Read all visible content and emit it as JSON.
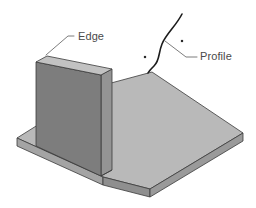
{
  "figure": {
    "background_color": "#ffffff",
    "annotations": [
      {
        "id": "edge",
        "label": "Edge",
        "text_x": 78,
        "text_y": 40,
        "leader_points": "74,36 68,36 46,55",
        "target": "top-left corner of vertical wall"
      },
      {
        "id": "profile",
        "label": "Profile",
        "text_x": 200,
        "text_y": 60,
        "leader_points": "197,57 186,57 165,41",
        "target": "free-form profile curve"
      }
    ],
    "point_markers": [
      {
        "id": "marker-left",
        "x": 145,
        "y": 57,
        "size": 2.2
      },
      {
        "id": "marker-right",
        "x": 182,
        "y": 41,
        "size": 2.2
      }
    ],
    "profile_curve": {
      "id": "profile-curve",
      "path": "M 182 14 C 176 26 166 34 162 44 C 158 54 160 60 154 66 C 151 69 149 71 148 73",
      "color": "#1c1c1c",
      "width": 1.6
    },
    "solid": {
      "name": "l-bracket",
      "colors": {
        "base_top": "#b9b9b9",
        "base_front": "#9a9a9a",
        "base_left": "#a4a4a4",
        "wall_face": "#7d7d7d",
        "wall_top": "#c2c2c2",
        "wall_side": "#949494",
        "outline": "#3b3b3b"
      },
      "faces": [
        {
          "id": "base-plate-top",
          "points": "17,138 100,86 152,72 243,133 150,189 103,177",
          "fill": "#b9b9b9"
        },
        {
          "id": "base-plate-front-right",
          "points": "243,133 243,141 150,197 150,189",
          "fill": "#9a9a9a"
        },
        {
          "id": "base-plate-front-left",
          "points": "150,189 150,197 103,185 103,177",
          "fill": "#8f8f8f"
        },
        {
          "id": "base-plate-left-tip",
          "points": "17,138 17,146 103,185 103,177",
          "fill": "#a4a4a4"
        },
        {
          "id": "wall-face",
          "points": "36,62 101,75 101,176 36,146",
          "fill": "#7d7d7d"
        },
        {
          "id": "wall-top",
          "points": "36,62 47,56 112,69 101,75",
          "fill": "#c2c2c2"
        },
        {
          "id": "wall-right-side",
          "points": "101,75 112,69 112,170 101,176",
          "fill": "#949494"
        }
      ]
    }
  }
}
